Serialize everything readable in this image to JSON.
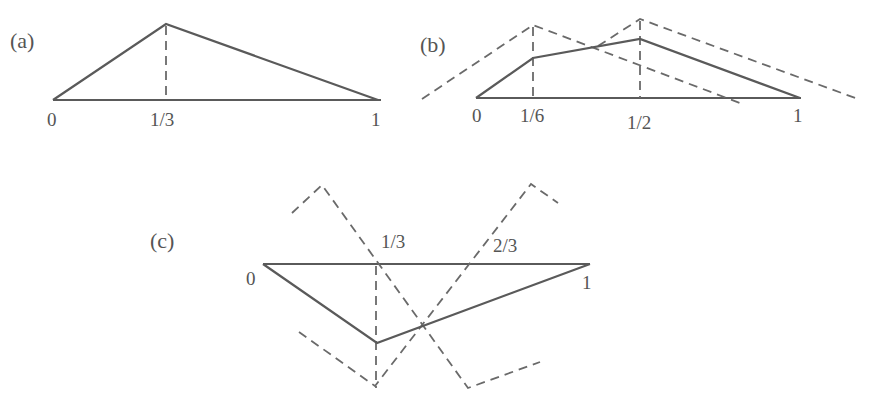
{
  "figure": {
    "panels": [
      {
        "id": "a",
        "label": "(a)",
        "ticks": [
          "0",
          "1/3",
          "1"
        ],
        "description": "Single hat function with peak at x=1/3 on interval [0,1]"
      },
      {
        "id": "b",
        "label": "(b)",
        "ticks": [
          "0",
          "1/6",
          "1/2",
          "1"
        ],
        "description": "Piecewise linear function with nodes at 1/6 and 1/2, shown with two dashed hat basis functions"
      },
      {
        "id": "c",
        "label": "(c)",
        "ticks": [
          "0",
          "1/3",
          "2/3",
          "1"
        ],
        "description": "Negative piecewise linear function with minimum at 1/3, shown with dashed hat basis functions at 1/3 and 2/3"
      }
    ]
  },
  "colors": {
    "line": "#5a5a5a",
    "dashed": "#6a6a6a",
    "text": "#555555",
    "background": "#ffffff"
  }
}
